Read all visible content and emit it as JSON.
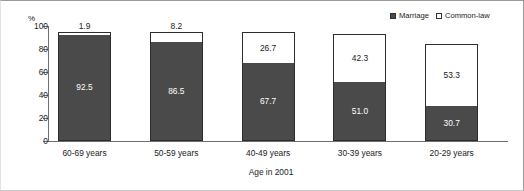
{
  "chart_data": {
    "type": "bar",
    "subtype": "stacked-bar",
    "title": "",
    "xlabel": "Age in 2001",
    "ylabel": "%",
    "ylim": [
      0,
      100
    ],
    "yticks": [
      0,
      20,
      40,
      60,
      80,
      100
    ],
    "grid": false,
    "legend_position": "top-right",
    "categories": [
      "60-69 years",
      "50-59 years",
      "40-49 years",
      "30-39 years",
      "20-29 years"
    ],
    "series": [
      {
        "name": "Marriage",
        "color": "#4a4a4a",
        "values": [
          92.5,
          86.5,
          67.7,
          51.0,
          30.7
        ],
        "labels": [
          "92.5",
          "86.5",
          "67.7",
          "51.0",
          "30.7"
        ]
      },
      {
        "name": "Common-law",
        "color": "#ffffff",
        "values": [
          1.9,
          8.2,
          26.7,
          42.3,
          53.3
        ],
        "labels": [
          "1.9",
          "8.2",
          "26.7",
          "42.3",
          "53.3"
        ]
      }
    ]
  },
  "axis": {
    "unit_label": "%",
    "y_ticks": [
      "100",
      "80",
      "60",
      "40",
      "20",
      "0"
    ],
    "x_title": "Age in 2001"
  },
  "legend": {
    "items": [
      {
        "label": "Marriage",
        "swatch": "filled-square"
      },
      {
        "label": "Common-law",
        "swatch": "hollow-square"
      }
    ]
  }
}
